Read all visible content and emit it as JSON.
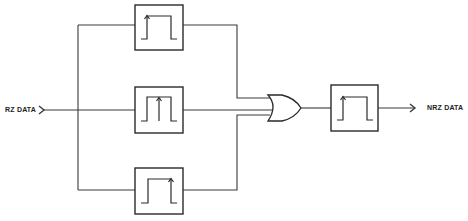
{
  "diagram": {
    "type": "block-diagram",
    "title": "",
    "input_label": "RZ DATA",
    "output_label": "NRZ DATA",
    "colors": {
      "line": "#2a2a2a",
      "background": "#ffffff"
    },
    "blocks": [
      {
        "id": "pulse-stretcher-top",
        "symbol": "square pulse with up-arrow at leading (rising) edge"
      },
      {
        "id": "pulse-stretcher-middle",
        "symbol": "square pulse with up-arrow at pulse center"
      },
      {
        "id": "pulse-stretcher-bottom",
        "symbol": "square pulse with up-arrow at trailing edge"
      },
      {
        "id": "or-gate",
        "symbol": "OR gate, 3 inputs"
      },
      {
        "id": "output-block",
        "symbol": "square pulse with up-arrow at leading (rising) edge"
      }
    ],
    "connections": [
      {
        "from": "RZ DATA",
        "to": "pulse-stretcher-top"
      },
      {
        "from": "RZ DATA",
        "to": "pulse-stretcher-middle"
      },
      {
        "from": "RZ DATA",
        "to": "pulse-stretcher-bottom"
      },
      {
        "from": "pulse-stretcher-top",
        "to": "or-gate"
      },
      {
        "from": "pulse-stretcher-middle",
        "to": "or-gate"
      },
      {
        "from": "pulse-stretcher-bottom",
        "to": "or-gate"
      },
      {
        "from": "or-gate",
        "to": "output-block"
      },
      {
        "from": "output-block",
        "to": "NRZ DATA"
      }
    ]
  }
}
